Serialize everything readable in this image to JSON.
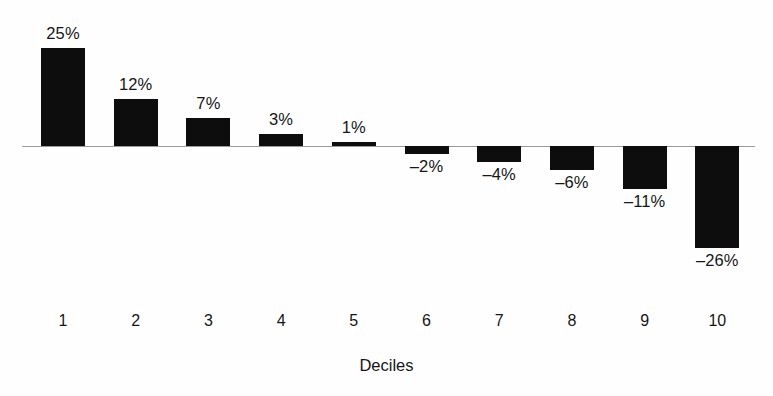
{
  "chart_data": {
    "type": "bar",
    "title": "",
    "subtitle": "",
    "xlabel": "Deciles",
    "ylabel": "",
    "categories": [
      "1",
      "2",
      "3",
      "4",
      "5",
      "6",
      "7",
      "8",
      "9",
      "10"
    ],
    "values": [
      25,
      12,
      7,
      3,
      1,
      -2,
      -4,
      -6,
      -11,
      -26
    ],
    "data_labels": [
      "25%",
      "12%",
      "7%",
      "3%",
      "1%",
      "–2%",
      "–4%",
      "–6%",
      "–11%",
      "–26%"
    ],
    "unit": "%",
    "ylim": [
      -30,
      28
    ],
    "grid": false,
    "legend": null,
    "legend_position": "none",
    "bar_color": "#0d0d0d",
    "baseline_color": "#9a9a9a",
    "background_color": "#fefefe",
    "text_color": "#161616",
    "annotations": []
  },
  "figure": {
    "axis_title": "Deciles"
  }
}
